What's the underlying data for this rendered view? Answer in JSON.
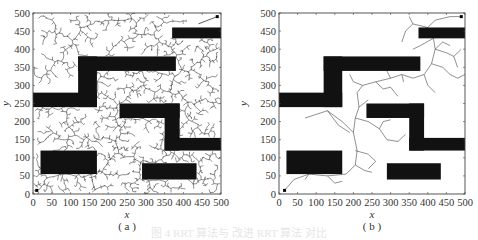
{
  "chart_data": [
    {
      "type": "scatter",
      "panel_label": "( a )",
      "title": "",
      "xlabel": "x",
      "ylabel": "y",
      "xlim": [
        0,
        500
      ],
      "ylim": [
        0,
        500
      ],
      "xticks": [
        0,
        50,
        100,
        150,
        200,
        250,
        300,
        350,
        400,
        450,
        500
      ],
      "yticks": [
        0,
        50,
        100,
        150,
        200,
        250,
        300,
        350,
        400,
        450,
        500
      ],
      "grid": false,
      "legend": null,
      "start_point": [
        10,
        10
      ],
      "goal_point": [
        490,
        490
      ],
      "obstacles": [
        {
          "x": [
            370,
            500
          ],
          "y": [
            430,
            460
          ]
        },
        {
          "x": [
            120,
            380
          ],
          "y": [
            340,
            380
          ]
        },
        {
          "x": [
            120,
            170
          ],
          "y": [
            240,
            380
          ]
        },
        {
          "x": [
            0,
            170
          ],
          "y": [
            240,
            280
          ]
        },
        {
          "x": [
            230,
            390
          ],
          "y": [
            210,
            250
          ]
        },
        {
          "x": [
            350,
            390
          ],
          "y": [
            120,
            250
          ]
        },
        {
          "x": [
            350,
            500
          ],
          "y": [
            120,
            155
          ]
        },
        {
          "x": [
            20,
            170
          ],
          "y": [
            55,
            120
          ]
        },
        {
          "x": [
            290,
            435
          ],
          "y": [
            40,
            85
          ]
        }
      ],
      "tree_density": "dense"
    },
    {
      "type": "scatter",
      "panel_label": "( b )",
      "title": "",
      "xlabel": "x",
      "ylabel": "y",
      "xlim": [
        0,
        500
      ],
      "ylim": [
        0,
        500
      ],
      "xticks": [
        0,
        50,
        100,
        150,
        200,
        250,
        300,
        350,
        400,
        450,
        500
      ],
      "yticks": [
        0,
        50,
        100,
        150,
        200,
        250,
        300,
        350,
        400,
        450,
        500
      ],
      "grid": false,
      "legend": null,
      "start_point": [
        15,
        10
      ],
      "goal_point": [
        490,
        490
      ],
      "obstacles": [
        {
          "x": [
            375,
            500
          ],
          "y": [
            430,
            460
          ]
        },
        {
          "x": [
            120,
            380
          ],
          "y": [
            340,
            380
          ]
        },
        {
          "x": [
            120,
            170
          ],
          "y": [
            240,
            380
          ]
        },
        {
          "x": [
            0,
            170
          ],
          "y": [
            240,
            280
          ]
        },
        {
          "x": [
            235,
            390
          ],
          "y": [
            210,
            250
          ]
        },
        {
          "x": [
            350,
            390
          ],
          "y": [
            120,
            250
          ]
        },
        {
          "x": [
            350,
            500
          ],
          "y": [
            120,
            155
          ]
        },
        {
          "x": [
            20,
            170
          ],
          "y": [
            55,
            120
          ]
        },
        {
          "x": [
            290,
            435
          ],
          "y": [
            40,
            85
          ]
        }
      ],
      "tree_density": "sparse",
      "main_path": [
        [
          15,
          10
        ],
        [
          40,
          40
        ],
        [
          80,
          55
        ],
        [
          130,
          50
        ],
        [
          180,
          55
        ],
        [
          205,
          80
        ],
        [
          210,
          120
        ],
        [
          200,
          170
        ],
        [
          205,
          210
        ],
        [
          215,
          240
        ],
        [
          210,
          280
        ],
        [
          225,
          300
        ],
        [
          260,
          310
        ],
        [
          300,
          320
        ],
        [
          330,
          330
        ],
        [
          360,
          320
        ],
        [
          390,
          330
        ],
        [
          410,
          360
        ],
        [
          420,
          400
        ],
        [
          415,
          430
        ],
        [
          400,
          460
        ],
        [
          420,
          480
        ],
        [
          460,
          490
        ],
        [
          490,
          490
        ]
      ],
      "branches": [
        [
          [
            200,
            170
          ],
          [
            170,
            200
          ],
          [
            130,
            230
          ],
          [
            100,
            220
          ],
          [
            70,
            210
          ]
        ],
        [
          [
            130,
            230
          ],
          [
            160,
            190
          ],
          [
            190,
            170
          ]
        ],
        [
          [
            205,
            210
          ],
          [
            240,
            200
          ],
          [
            270,
            180
          ],
          [
            290,
            150
          ],
          [
            320,
            145
          ],
          [
            340,
            165
          ]
        ],
        [
          [
            270,
            180
          ],
          [
            280,
            200
          ],
          [
            300,
            205
          ]
        ],
        [
          [
            205,
            120
          ],
          [
            240,
            110
          ],
          [
            260,
            90
          ],
          [
            240,
            70
          ]
        ],
        [
          [
            205,
            80
          ],
          [
            230,
            65
          ],
          [
            250,
            60
          ]
        ],
        [
          [
            130,
            50
          ],
          [
            150,
            30
          ],
          [
            170,
            35
          ]
        ],
        [
          [
            80,
            55
          ],
          [
            70,
            40
          ]
        ],
        [
          [
            215,
            240
          ],
          [
            240,
            260
          ]
        ],
        [
          [
            260,
            310
          ],
          [
            280,
            290
          ],
          [
            300,
            295
          ],
          [
            320,
            270
          ]
        ],
        [
          [
            330,
            330
          ],
          [
            335,
            310
          ]
        ],
        [
          [
            390,
            330
          ],
          [
            400,
            300
          ],
          [
            420,
            280
          ]
        ],
        [
          [
            410,
            360
          ],
          [
            440,
            350
          ],
          [
            460,
            330
          ],
          [
            480,
            320
          ],
          [
            500,
            330
          ]
        ],
        [
          [
            420,
            400
          ],
          [
            450,
            390
          ],
          [
            470,
            380
          ],
          [
            490,
            400
          ]
        ],
        [
          [
            420,
            400
          ],
          [
            440,
            420
          ],
          [
            460,
            410
          ]
        ],
        [
          [
            415,
            430
          ],
          [
            380,
            410
          ],
          [
            360,
            400
          ]
        ],
        [
          [
            400,
            460
          ],
          [
            360,
            470
          ],
          [
            340,
            450
          ],
          [
            330,
            420
          ]
        ],
        [
          [
            360,
            470
          ],
          [
            350,
            490
          ]
        ],
        [
          [
            470,
            380
          ],
          [
            480,
            350
          ]
        ],
        [
          [
            300,
            320
          ],
          [
            290,
            340
          ]
        ],
        [
          [
            225,
            300
          ],
          [
            200,
            310
          ],
          [
            190,
            330
          ]
        ]
      ]
    }
  ],
  "panels": {
    "a": {
      "label": "( a )",
      "xlabel": "x",
      "ylabel": "y"
    },
    "b": {
      "label": "( b )",
      "xlabel": "x",
      "ylabel": "y"
    }
  },
  "caption": "图 4   RRT 算法与 改进 RRT 算法 对比"
}
